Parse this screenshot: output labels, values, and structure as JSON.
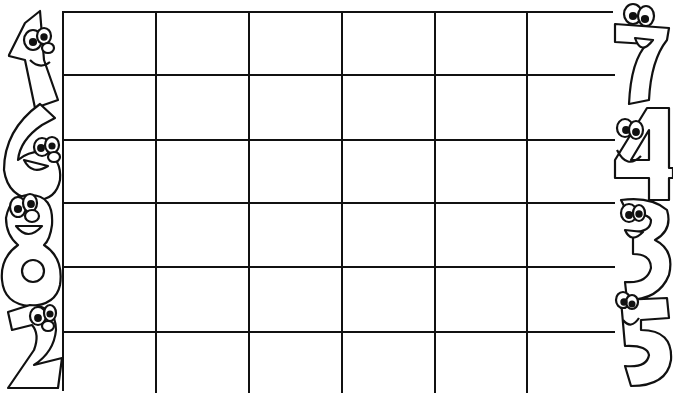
{
  "page": {
    "type": "coloring-page",
    "background_color": "#ffffff",
    "line_color": "#111111"
  },
  "grid": {
    "rows": 6,
    "columns": 6,
    "cells": [
      [
        "",
        "",
        "",
        "",
        "",
        ""
      ],
      [
        "",
        "",
        "",
        "",
        "",
        ""
      ],
      [
        "",
        "",
        "",
        "",
        "",
        ""
      ],
      [
        "",
        "",
        "",
        "",
        "",
        ""
      ],
      [
        "",
        "",
        "",
        "",
        "",
        ""
      ],
      [
        "",
        "",
        "",
        "",
        "",
        ""
      ]
    ]
  },
  "left_characters": [
    {
      "digit": "1",
      "label": "number-one-character"
    },
    {
      "digit": "6",
      "label": "number-six-character"
    },
    {
      "digit": "8",
      "label": "number-eight-character"
    },
    {
      "digit": "2",
      "label": "number-two-character"
    }
  ],
  "right_characters": [
    {
      "digit": "7",
      "label": "number-seven-character"
    },
    {
      "digit": "4",
      "label": "number-four-character"
    },
    {
      "digit": "3",
      "label": "number-three-character"
    },
    {
      "digit": "5",
      "label": "number-five-character"
    }
  ]
}
